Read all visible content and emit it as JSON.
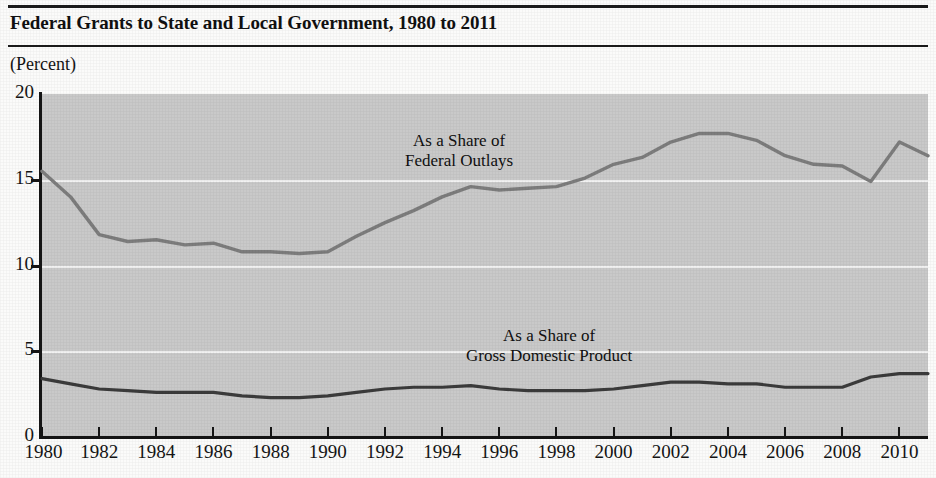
{
  "figure": {
    "title": "Federal Grants to State and Local Government, 1980 to 2011",
    "unit_label": "(Percent)"
  },
  "chart_data": {
    "type": "line",
    "title": "Federal Grants to State and Local Government, 1980 to 2011",
    "subtitle": "",
    "xlabel": "",
    "ylabel": "(Percent)",
    "xlim": [
      1980,
      2011
    ],
    "ylim": [
      0,
      20
    ],
    "ytick_labels": [
      "0",
      "5",
      "10",
      "15",
      "20"
    ],
    "yticks": [
      0,
      5,
      10,
      15,
      20
    ],
    "xtick_labels": [
      "1980",
      "1982",
      "1984",
      "1986",
      "1988",
      "1990",
      "1992",
      "1994",
      "1996",
      "1998",
      "2000",
      "2002",
      "2004",
      "2006",
      "2008",
      "2010"
    ],
    "xticks": [
      1980,
      1982,
      1984,
      1986,
      1988,
      1990,
      1992,
      1994,
      1996,
      1998,
      2000,
      2002,
      2004,
      2006,
      2008,
      2010
    ],
    "grid": "horizontal-white",
    "plot_background": "#c9c9c9",
    "legend_position": "inline-annotation",
    "x": [
      1980,
      1981,
      1982,
      1983,
      1984,
      1985,
      1986,
      1987,
      1988,
      1989,
      1990,
      1991,
      1992,
      1993,
      1994,
      1995,
      1996,
      1997,
      1998,
      1999,
      2000,
      2001,
      2002,
      2003,
      2004,
      2005,
      2006,
      2007,
      2008,
      2009,
      2010,
      2011
    ],
    "series": [
      {
        "name": "As a Share of Federal Outlays",
        "annotation_line1": "As a Share of",
        "annotation_line2": "Federal Outlays",
        "color": "#7d7d7d",
        "values": [
          15.5,
          14.0,
          11.8,
          11.4,
          11.5,
          11.2,
          11.3,
          10.8,
          10.8,
          10.7,
          10.8,
          11.7,
          12.5,
          13.2,
          14.0,
          14.6,
          14.4,
          14.5,
          14.6,
          15.1,
          15.9,
          16.3,
          17.2,
          17.7,
          17.7,
          17.3,
          16.4,
          15.9,
          15.8,
          14.9,
          17.2,
          16.4
        ]
      },
      {
        "name": "As a Share of Gross Domestic Product",
        "annotation_line1": "As a Share of",
        "annotation_line2": "Gross Domestic Product",
        "color": "#3b3b3b",
        "values": [
          3.4,
          3.1,
          2.8,
          2.7,
          2.6,
          2.6,
          2.6,
          2.4,
          2.3,
          2.3,
          2.4,
          2.6,
          2.8,
          2.9,
          2.9,
          3.0,
          2.8,
          2.7,
          2.7,
          2.7,
          2.8,
          3.0,
          3.2,
          3.2,
          3.1,
          3.1,
          2.9,
          2.9,
          2.9,
          3.5,
          3.7,
          3.7
        ]
      }
    ]
  }
}
